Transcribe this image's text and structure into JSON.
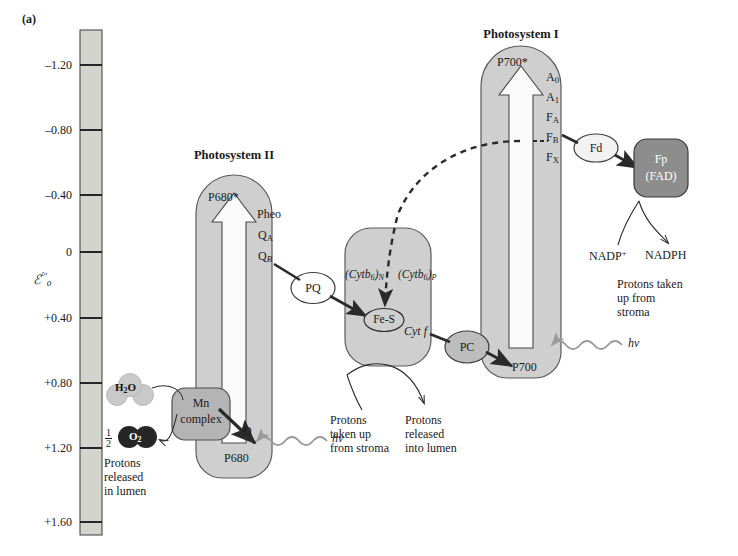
{
  "figure": {
    "panel_letter": "(a)",
    "axis": {
      "name": "ℰ°'",
      "ticks": [
        "–1.20",
        "–0.80",
        "–0.40",
        "0",
        "+0.40",
        "+0.80",
        "+1.20",
        "+1.60"
      ],
      "top_value": "–1.60",
      "bottom_value": "+1.80"
    },
    "photosystem2": {
      "title": "Photosystem II",
      "excited": "P680*",
      "ground": "P680",
      "carriers": [
        "Pheo",
        "Q",
        "Q"
      ],
      "carrier_qa_sub": "A",
      "carrier_qb_sub": "B",
      "donor": "D",
      "photon": "hν"
    },
    "oec": {
      "complex_line1": "Mn",
      "complex_line2": "complex",
      "water": "H",
      "water_sub": "2",
      "water_end": "O",
      "oxygen": "O",
      "oxygen_sub": "2",
      "oxygen_coefficient_num": "1",
      "oxygen_coefficient_den": "2",
      "note": "Protons\nreleased\nin lumen",
      "note_lines": [
        "Protons",
        "released",
        "in lumen"
      ]
    },
    "plastoquinone": {
      "label": "PQ"
    },
    "cytochrome_complex": {
      "cytb6_n": "(Cytb",
      "cytb6_n_sub": "6",
      "cytb6_n_suffix": ")",
      "cytb6_n_italic_sub": "N",
      "cytb6_p_italic_sub": "P",
      "fes": "Fe-S",
      "cytf": "Cyt f",
      "note_left_lines": [
        "Protons",
        "taken up",
        "from stroma"
      ],
      "note_right_lines": [
        "Protons",
        "released",
        "into lumen"
      ]
    },
    "plastocyanin": {
      "label": "PC"
    },
    "photosystem1": {
      "title": "Photosystem I",
      "excited": "P700*",
      "ground": "P700",
      "carriers": [
        "A",
        "A",
        "F",
        "F",
        "F"
      ],
      "carrier_subs": [
        "0",
        "1",
        "A",
        "B",
        "X"
      ],
      "photon": "hν"
    },
    "ferredoxin": {
      "label": "Fd"
    },
    "flavoprotein": {
      "line1": "Fp",
      "line2": "(FAD)"
    },
    "nadp": {
      "substrate": "NADP",
      "substrate_sup": "+",
      "product": "NADPH",
      "note_lines": [
        "Protons taken",
        "up from",
        "stroma"
      ]
    },
    "colors": {
      "box_fill": "#cfcfcf",
      "box_stroke": "#5b5b5b",
      "arrow_fill": "#fbfbfb",
      "dark_node": "#8d8d8d",
      "darkest_node": "#2b2b2b",
      "light_node": "#c9c9c9",
      "axis_fill": "#d4d4cf",
      "line": "#2a2a2a",
      "squiggle": "#9a9a9a"
    }
  }
}
